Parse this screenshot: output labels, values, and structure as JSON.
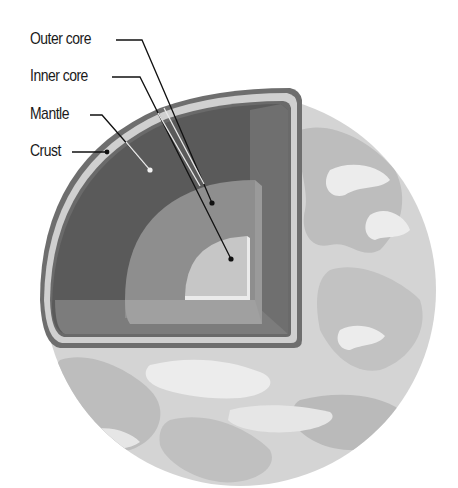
{
  "diagram": {
    "labels": [
      {
        "id": "outer-core",
        "text": "Outer core"
      },
      {
        "id": "inner-core",
        "text": "Inner core"
      },
      {
        "id": "mantle",
        "text": "Mantle"
      },
      {
        "id": "crust",
        "text": "Crust"
      }
    ],
    "colors": {
      "globe_base": "#d4d4d4",
      "globe_land": "#bdbdbd",
      "globe_cloud": "#ececec",
      "crust_outline": "#6e6e6e",
      "crust_fill": "#cfcfcf",
      "mantle": "#5a5a5a",
      "mantle_side": "#7a7a7a",
      "outer_core": "#8e8e8e",
      "outer_core_side": "#9e9e9e",
      "inner_core": "#c6c6c6",
      "inner_core_edge": "#e8e8e8",
      "leader_line": "#111111",
      "text": "#1a1a1a"
    }
  }
}
